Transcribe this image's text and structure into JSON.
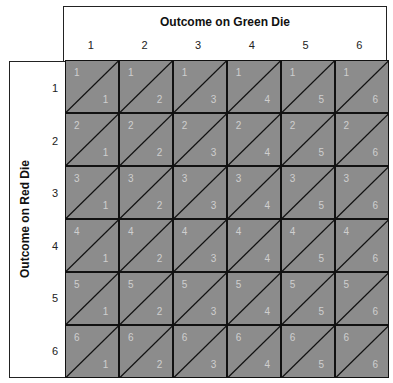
{
  "top_title": "Outcome on Green Die",
  "left_title": "Outcome on Red Die",
  "columns": [
    "1",
    "2",
    "3",
    "4",
    "5",
    "6"
  ],
  "rows": [
    "1",
    "2",
    "3",
    "4",
    "5",
    "6"
  ],
  "colors": {
    "cell": "#8c8c8c",
    "cell_text": "#cfcfcf",
    "lines": "#111111"
  },
  "cells": [
    [
      {
        "r": "1",
        "g": "1"
      },
      {
        "r": "1",
        "g": "2"
      },
      {
        "r": "1",
        "g": "3"
      },
      {
        "r": "1",
        "g": "4"
      },
      {
        "r": "1",
        "g": "5"
      },
      {
        "r": "1",
        "g": "6"
      }
    ],
    [
      {
        "r": "2",
        "g": "1"
      },
      {
        "r": "2",
        "g": "2"
      },
      {
        "r": "2",
        "g": "3"
      },
      {
        "r": "2",
        "g": "4"
      },
      {
        "r": "2",
        "g": "5"
      },
      {
        "r": "2",
        "g": "6"
      }
    ],
    [
      {
        "r": "3",
        "g": "1"
      },
      {
        "r": "3",
        "g": "2"
      },
      {
        "r": "3",
        "g": "3"
      },
      {
        "r": "3",
        "g": "4"
      },
      {
        "r": "3",
        "g": "5"
      },
      {
        "r": "3",
        "g": "6"
      }
    ],
    [
      {
        "r": "4",
        "g": "1"
      },
      {
        "r": "4",
        "g": "2"
      },
      {
        "r": "4",
        "g": "3"
      },
      {
        "r": "4",
        "g": "4"
      },
      {
        "r": "4",
        "g": "5"
      },
      {
        "r": "4",
        "g": "6"
      }
    ],
    [
      {
        "r": "5",
        "g": "1"
      },
      {
        "r": "5",
        "g": "2"
      },
      {
        "r": "5",
        "g": "3"
      },
      {
        "r": "5",
        "g": "4"
      },
      {
        "r": "5",
        "g": "5"
      },
      {
        "r": "5",
        "g": "6"
      }
    ],
    [
      {
        "r": "6",
        "g": "1"
      },
      {
        "r": "6",
        "g": "2"
      },
      {
        "r": "6",
        "g": "3"
      },
      {
        "r": "6",
        "g": "4"
      },
      {
        "r": "6",
        "g": "5"
      },
      {
        "r": "6",
        "g": "6"
      }
    ]
  ]
}
